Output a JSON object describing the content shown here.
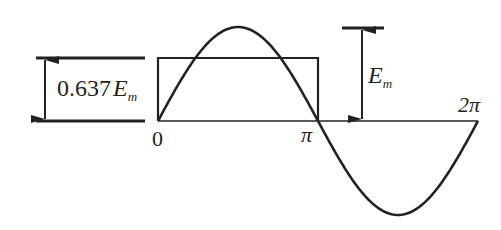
{
  "figure": {
    "labels": {
      "avg_coeff": "0.637",
      "avg_symbol": "E",
      "avg_sub": "m",
      "amp_symbol": "E",
      "amp_sub": "m",
      "x_zero": "0",
      "x_pi": "π",
      "x_2pi": "2π"
    },
    "colors": {
      "stroke": "#222222",
      "background": "#ffffff"
    },
    "geometry": {
      "origin_x": 158,
      "axis_y": 121,
      "pi_x": 318,
      "two_pi_x": 478,
      "amplitude_px": 94,
      "rect_height_px": 63
    }
  }
}
